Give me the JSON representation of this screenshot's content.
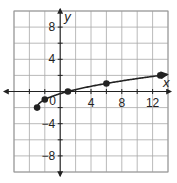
{
  "chart_data": {
    "type": "line",
    "title": "",
    "function": "y = sqrt(x + 3) - 2",
    "xlabel": "x",
    "ylabel": "y",
    "xlim": [
      -6,
      14
    ],
    "ylim": [
      -10,
      10
    ],
    "grid": true,
    "grid_step": 2,
    "x_tick_labels": [
      {
        "value": 4,
        "label": "4"
      },
      {
        "value": 8,
        "label": "8"
      },
      {
        "value": 12,
        "label": "12"
      }
    ],
    "y_tick_labels": [
      {
        "value": 8,
        "label": "8"
      },
      {
        "value": 4,
        "label": "4"
      },
      {
        "value": -4,
        "label": "−4"
      },
      {
        "value": -8,
        "label": "−8"
      }
    ],
    "origin_label": "0",
    "series": [
      {
        "name": "curve",
        "points": [
          [
            -3,
            -2
          ],
          [
            -2,
            -1
          ],
          [
            1,
            0
          ],
          [
            6,
            1
          ],
          [
            13,
            2
          ]
        ],
        "marked_points": [
          [
            -3,
            -2
          ],
          [
            -2,
            -1
          ],
          [
            1,
            0
          ],
          [
            6,
            1
          ],
          [
            13,
            2
          ]
        ],
        "end_arrow": true
      }
    ]
  }
}
